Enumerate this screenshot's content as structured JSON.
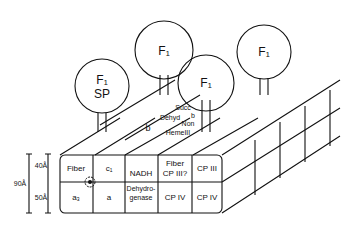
{
  "diagram": {
    "f1_particles": [
      {
        "label": "F₁",
        "sub": "SP"
      },
      {
        "label": "F₁"
      },
      {
        "label": "F₁"
      },
      {
        "label": "F₁"
      }
    ],
    "front_top_row": [
      "Fiber",
      "c₁",
      "NADH",
      "Fiber",
      "CP III",
      "CP III"
    ],
    "front_top_row_extra": "CP III?",
    "front_bottom_row": [
      "a₃",
      "a",
      "Dehydro-",
      "genase",
      "CP IV",
      "CP IV"
    ],
    "top_labels": {
      "succ": "Succ",
      "dehyd": "Dehyd",
      "b_small": "b",
      "non": "Non",
      "heme": "HemeIII",
      "b": "b"
    },
    "dimensions": {
      "total": "90Å",
      "upper": "40Å",
      "lower": "50Å"
    }
  }
}
